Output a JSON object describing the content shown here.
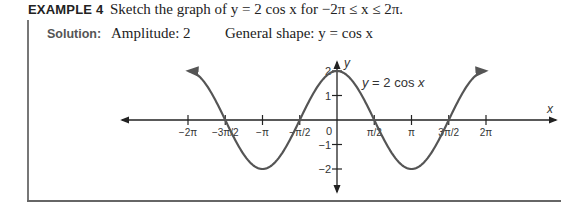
{
  "header": {
    "example_label": "EXAMPLE 4",
    "problem_text": "Sketch the graph of y = 2 cos x for −2π ≤ x ≤ 2π."
  },
  "solution": {
    "label": "Solution:",
    "amplitude": "Amplitude: 2",
    "general_shape": "General shape: y = cos x"
  },
  "chart_data": {
    "type": "line",
    "title": "",
    "function": "y = 2 cos x",
    "curve_label": "y = 2 cos x",
    "xlabel": "x",
    "ylabel": "y",
    "xlim": [
      -6.2832,
      6.2832
    ],
    "ylim": [
      -2,
      2
    ],
    "x_ticks": [
      "−2π",
      "−3π/2",
      "−π",
      "−π/2",
      "0",
      "π/2",
      "π",
      "3π/2",
      "2π"
    ],
    "x_tick_values": [
      -6.2832,
      -4.7124,
      -3.1416,
      -1.5708,
      0,
      1.5708,
      3.1416,
      4.7124,
      6.2832
    ],
    "y_ticks": [
      "2",
      "1",
      "−1",
      "−2"
    ],
    "y_tick_values": [
      2,
      1,
      -1,
      -2
    ],
    "x": [
      -6.2832,
      -4.7124,
      -3.1416,
      -1.5708,
      0,
      1.5708,
      3.1416,
      4.7124,
      6.2832
    ],
    "values": [
      2,
      0,
      -2,
      0,
      2,
      0,
      -2,
      0,
      2
    ],
    "grid": false,
    "legend": "none"
  }
}
